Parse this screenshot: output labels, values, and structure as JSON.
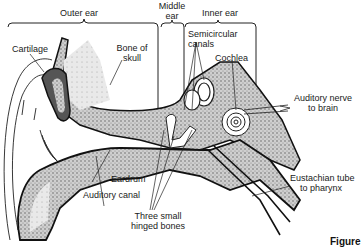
{
  "diagram": {
    "type": "anatomy-diagram",
    "regions": [
      {
        "id": "outer",
        "label": "Outer ear"
      },
      {
        "id": "middle",
        "label": "Middle\near",
        "line1": "Middle",
        "line2": "ear"
      },
      {
        "id": "inner",
        "label": "Inner ear"
      }
    ],
    "labels": {
      "cartilage": "Cartilage",
      "bone_of_skull_1": "Bone of",
      "bone_of_skull_2": "skull",
      "semicircular_1": "Semicircular",
      "semicircular_2": "canals",
      "cochlea": "Cochlea",
      "auditory_nerve_1": "Auditory nerve",
      "auditory_nerve_2": "to brain",
      "eardrum": "Eardrum",
      "auditory_canal": "Auditory canal",
      "three_bones_1": "Three small",
      "three_bones_2": "hinged bones",
      "eustachian_1": "Eustachian tube",
      "eustachian_2": "to pharynx"
    },
    "caption_fragment": "Figure"
  }
}
